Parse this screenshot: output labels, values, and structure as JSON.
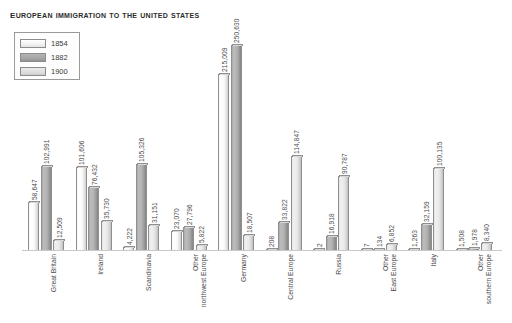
{
  "chart_data": {
    "type": "bar",
    "title": "European immigration to the United States",
    "xlabel": "",
    "ylabel": "",
    "ylim": [
      0,
      250630
    ],
    "grid": false,
    "legend_position": "top-left",
    "categories": [
      "Great Britain",
      "Ireland",
      "Scandinavia",
      "Other\nnorthwest Europe",
      "Germany",
      "Central Europe",
      "Russia",
      "Other\nEast Europe",
      "Italy",
      "Other\nsouthern Europe"
    ],
    "series": [
      {
        "name": "1854",
        "values": [
          58647,
          101606,
          4222,
          23070,
          215009,
          208,
          2,
          7,
          1263,
          1508
        ],
        "labels": [
          "58,647",
          "101,606",
          "4,222",
          "23,070",
          "215,009",
          "208",
          "2",
          "7",
          "1,263",
          "1,508"
        ]
      },
      {
        "name": "1882",
        "values": [
          102991,
          76432,
          105326,
          27796,
          250630,
          33822,
          16918,
          134,
          32159,
          1978
        ],
        "labels": [
          "102,991",
          "76,432",
          "105,326",
          "27,796",
          "250,630",
          "33,822",
          "16,918",
          "134",
          "32,159",
          "1,978"
        ]
      },
      {
        "name": "1900",
        "values": [
          12509,
          35730,
          31151,
          5822,
          18507,
          114847,
          90787,
          6852,
          100135,
          8340
        ],
        "labels": [
          "12,509",
          "35,730",
          "31,151",
          "5,822",
          "18,507",
          "114,847",
          "90,787",
          "6,852",
          "100,135",
          "8,340"
        ]
      }
    ],
    "colors": {
      "series_1854": "#fbfbfb",
      "series_1882": "#b2b2b2",
      "series_1900": "#eaeaea",
      "outline": "#8f8f8f",
      "text": "#4a4a4a",
      "title": "#2b2b2b"
    }
  },
  "legend": {
    "entries": [
      {
        "label": "1854"
      },
      {
        "label": "1882"
      },
      {
        "label": "1900"
      }
    ]
  }
}
